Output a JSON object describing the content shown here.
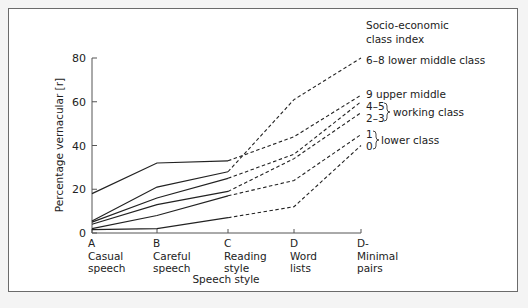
{
  "chart_data": {
    "type": "line",
    "title": "",
    "xlabel": "Speech style",
    "ylabel": "Percentage vernacular [r]",
    "ylim": [
      0,
      80
    ],
    "yticks": [
      0,
      20,
      40,
      60,
      80
    ],
    "grid": false,
    "categories": [
      {
        "letter": "A",
        "line1": "Casual",
        "line2": "speech"
      },
      {
        "letter": "B",
        "line1": "Careful",
        "line2": "speech"
      },
      {
        "letter": "C",
        "line1": "Reading",
        "line2": "style"
      },
      {
        "letter": "D",
        "line1": "Word",
        "line2": "lists"
      },
      {
        "letter": "D-",
        "line1": "Minimal",
        "line2": "pairs"
      }
    ],
    "legend_title_line1": "Socio-economic",
    "legend_title_line2": "class index",
    "series": [
      {
        "name": "6–8 lower middle class",
        "index": "6–8",
        "values": [
          5.5,
          21,
          28,
          61,
          80
        ]
      },
      {
        "name": "9 upper middle",
        "index": "9",
        "values": [
          18,
          32,
          33,
          44,
          63
        ]
      },
      {
        "name": "4–5 working class",
        "index": "4–5",
        "values": [
          5,
          16,
          25,
          36,
          60
        ]
      },
      {
        "name": "2–3 working class",
        "index": "2–3",
        "values": [
          4,
          13,
          19,
          34,
          55
        ]
      },
      {
        "name": "1 lower class",
        "index": "1",
        "values": [
          2,
          8,
          17,
          24,
          45
        ]
      },
      {
        "name": "0 lower class",
        "index": "0",
        "values": [
          1.5,
          2,
          7,
          12,
          40
        ]
      }
    ],
    "annotations": {
      "lower_middle": "6–8 lower middle class",
      "upper_middle": "9 upper middle",
      "working_45": "4–5",
      "working_23": "2–3",
      "working_label": "working class",
      "lower_1": "1",
      "lower_0": "0",
      "lower_label": "lower class"
    },
    "solid_segments": "A–C",
    "dashed_segments": "C–D-"
  }
}
